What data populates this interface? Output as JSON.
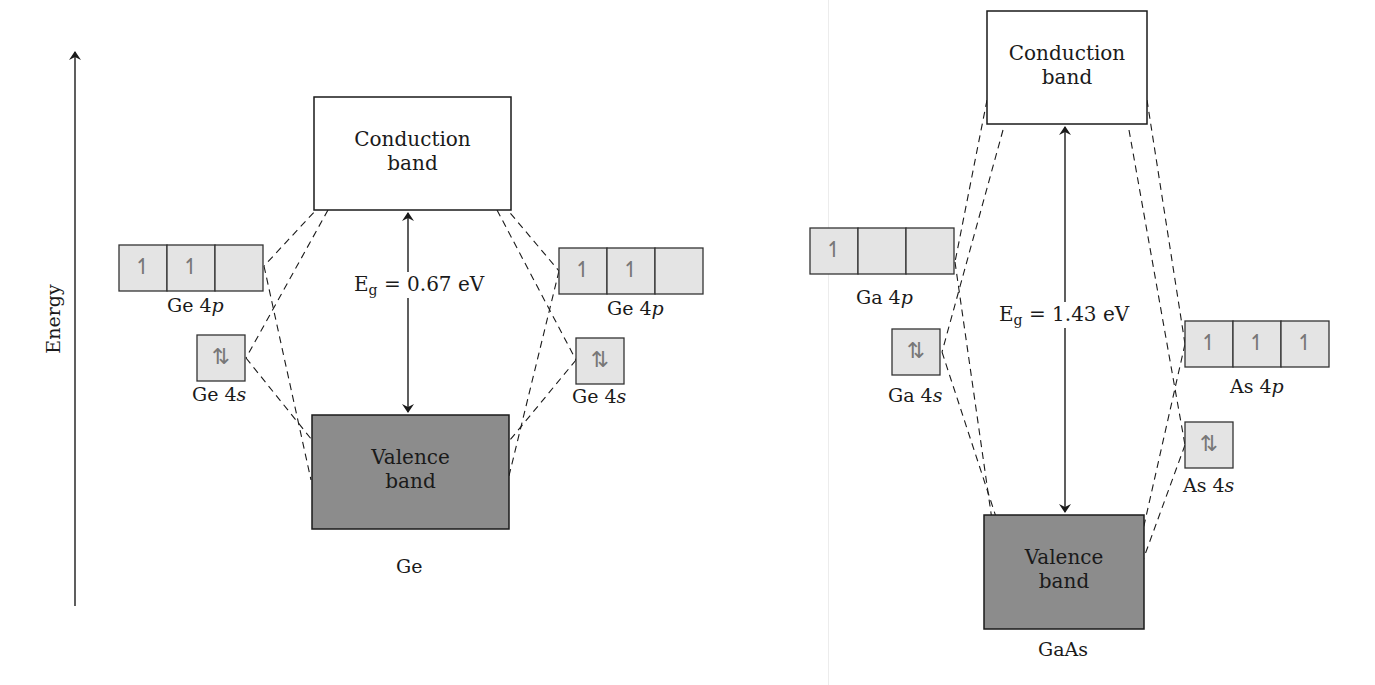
{
  "axis": {
    "label": "Energy",
    "x": 75,
    "y_top": 52,
    "y_bottom": 606
  },
  "colors": {
    "line": "#1a1a1a",
    "orbital_fill": "#e4e4e4",
    "orbital_border": "#333333",
    "valence_fill": "#8c8c8c",
    "conduction_fill": "#ffffff",
    "arrow_glyph": "#777777"
  },
  "diagrams": [
    {
      "id": "ge",
      "material": "Ge",
      "band_gap_label": "E",
      "band_gap_sub": "g",
      "band_gap_value": "= 0.67 eV",
      "conduction": {
        "label_line1": "Conduction",
        "label_line2": "band",
        "x": 314,
        "y": 97,
        "w": 197,
        "h": 113
      },
      "valence": {
        "label_line1": "Valence",
        "label_line2": "band",
        "x": 312,
        "y": 415,
        "w": 197,
        "h": 114
      },
      "material_label_pos": {
        "x": 410,
        "y": 557
      },
      "gap_arrow": {
        "x": 408,
        "y1": 213,
        "y2": 412
      },
      "eg_label_pos": {
        "x": 352,
        "y": 272
      },
      "orbitals": [
        {
          "name": "Ge 4p",
          "side": "left",
          "x": 119,
          "y": 245,
          "cells": 3,
          "cell_w": 48,
          "h": 46,
          "electrons": [
            "↿",
            "↿",
            ""
          ],
          "label": "Ge 4",
          "label_sub": "p",
          "label_x": 167,
          "label_y": 296
        },
        {
          "name": "Ge 4s",
          "side": "left",
          "x": 197,
          "y": 335,
          "cells": 1,
          "cell_w": 48,
          "h": 46,
          "electrons": [
            "⇅"
          ],
          "label": "Ge 4",
          "label_sub": "s",
          "label_x": 192,
          "label_y": 385
        },
        {
          "name": "Ge 4p",
          "side": "right",
          "x": 559,
          "y": 248,
          "cells": 3,
          "cell_w": 48,
          "h": 46,
          "electrons": [
            "↿",
            "↿",
            ""
          ],
          "label": "Ge 4",
          "label_sub": "p",
          "label_x": 607,
          "label_y": 299
        },
        {
          "name": "Ge 4s",
          "side": "right",
          "x": 576,
          "y": 338,
          "cells": 1,
          "cell_w": 48,
          "h": 46,
          "electrons": [
            "⇅"
          ],
          "label": "Ge 4",
          "label_sub": "s",
          "label_x": 572,
          "label_y": 387
        }
      ],
      "dashed_lines": [
        [
          330,
          195,
          264,
          266
        ],
        [
          264,
          266,
          311,
          480
        ],
        [
          328,
          210,
          246,
          358
        ],
        [
          246,
          358,
          312,
          440
        ],
        [
          495,
          195,
          559,
          271
        ],
        [
          559,
          271,
          508,
          480
        ],
        [
          497,
          210,
          576,
          360
        ],
        [
          576,
          360,
          510,
          440
        ]
      ]
    },
    {
      "id": "gaas",
      "material": "GaAs",
      "band_gap_label": "E",
      "band_gap_sub": "g",
      "band_gap_value": "= 1.43 eV",
      "conduction": {
        "label_line1": "Conduction",
        "label_line2": "band",
        "x": 987,
        "y": 11,
        "w": 160,
        "h": 113
      },
      "valence": {
        "label_line1": "Valence",
        "label_line2": "band",
        "x": 984,
        "y": 515,
        "w": 160,
        "h": 114
      },
      "material_label_pos": {
        "x": 1064,
        "y": 640
      },
      "gap_arrow": {
        "x": 1065,
        "y1": 127,
        "y2": 512
      },
      "eg_label_pos": {
        "x": 997,
        "y": 302
      },
      "orbitals": [
        {
          "name": "Ga 4p",
          "side": "left",
          "x": 810,
          "y": 228,
          "cells": 3,
          "cell_w": 48,
          "h": 46,
          "electrons": [
            "↿",
            "",
            ""
          ],
          "label": "Ga 4",
          "label_sub": "p",
          "label_x": 856,
          "label_y": 288
        },
        {
          "name": "Ga 4s",
          "side": "left",
          "x": 892,
          "y": 329,
          "cells": 1,
          "cell_w": 48,
          "h": 46,
          "electrons": [
            "⇅"
          ],
          "label": "Ga 4",
          "label_sub": "s",
          "label_x": 888,
          "label_y": 386
        },
        {
          "name": "As 4p",
          "side": "right",
          "x": 1185,
          "y": 321,
          "cells": 3,
          "cell_w": 48,
          "h": 46,
          "electrons": [
            "↿",
            "↿",
            "↿"
          ],
          "label": "As 4",
          "label_sub": "p",
          "label_x": 1230,
          "label_y": 377
        },
        {
          "name": "As 4s",
          "side": "right",
          "x": 1185,
          "y": 422,
          "cells": 1,
          "cell_w": 48,
          "h": 46,
          "electrons": [
            "⇅"
          ],
          "label": "As 4",
          "label_sub": "s",
          "label_x": 1183,
          "label_y": 476
        }
      ],
      "dashed_lines": [
        [
          987,
          100,
          955,
          262
        ],
        [
          955,
          262,
          992,
          520
        ],
        [
          1003,
          130,
          942,
          352
        ],
        [
          942,
          352,
          997,
          520
        ],
        [
          1147,
          100,
          1185,
          344
        ],
        [
          1185,
          344,
          1143,
          530
        ],
        [
          1129,
          130,
          1185,
          445
        ],
        [
          1185,
          445,
          1143,
          560
        ]
      ]
    }
  ]
}
